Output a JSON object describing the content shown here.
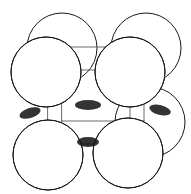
{
  "figure": {
    "caption": "",
    "width": 191,
    "height": 194,
    "background_color": "#ffffff",
    "style": "stippled pen-and-ink line drawing"
  },
  "colors": {
    "background": "#ffffff",
    "sphere_outline": "#1a1a1a",
    "cube_edge": "#5a5a5a",
    "stipple_dark": "#111111",
    "stipple_mid": "#3a3a3a",
    "highlight": "#ffffff"
  },
  "cube": {
    "label": "unit-cell-wireframe",
    "projection": "oblique",
    "depth_offset_x": 14,
    "depth_offset_y": -23,
    "front_face": {
      "x": 48,
      "y": 70,
      "width": 82,
      "height": 74
    },
    "front_corners": [
      {
        "name": "front-top-left",
        "x": 48,
        "y": 70
      },
      {
        "name": "front-top-right",
        "x": 130,
        "y": 70
      },
      {
        "name": "front-bottom-right",
        "x": 130,
        "y": 144
      },
      {
        "name": "front-bottom-left",
        "x": 48,
        "y": 144
      }
    ],
    "back_corners": [
      {
        "name": "back-top-left",
        "x": 62,
        "y": 47
      },
      {
        "name": "back-top-right",
        "x": 144,
        "y": 47
      },
      {
        "name": "back-bottom-right",
        "x": 144,
        "y": 121
      },
      {
        "name": "back-bottom-left",
        "x": 62,
        "y": 121
      }
    ]
  },
  "spheres": [
    {
      "name": "atom-back-top-left",
      "cx": 62,
      "cy": 48,
      "r": 35,
      "layer": "back",
      "shade": "dark"
    },
    {
      "name": "atom-back-top-right",
      "cx": 146,
      "cy": 48,
      "r": 35,
      "layer": "back",
      "shade": "dark"
    },
    {
      "name": "atom-back-bottom-right",
      "cx": 150,
      "cy": 122,
      "r": 35,
      "layer": "back",
      "shade": "dark"
    },
    {
      "name": "atom-front-top-left",
      "cx": 46,
      "cy": 72,
      "r": 35,
      "layer": "front",
      "shade": "light"
    },
    {
      "name": "atom-front-top-right",
      "cx": 130,
      "cy": 72,
      "r": 35,
      "layer": "front",
      "shade": "light"
    },
    {
      "name": "atom-front-bottom-left",
      "cx": 48,
      "cy": 155,
      "r": 35,
      "layer": "front",
      "shade": "light"
    },
    {
      "name": "atom-front-bottom-right",
      "cx": 128,
      "cy": 153,
      "r": 35,
      "layer": "front",
      "shade": "light"
    }
  ],
  "lighting": {
    "source": "upper-left",
    "highlight_offset_x": -0.38,
    "highlight_offset_y": -0.42,
    "shadow_side": "lower-right"
  },
  "contacts": [
    {
      "name": "contact-left",
      "x": 30,
      "y": 113
    },
    {
      "name": "contact-center-top",
      "x": 88,
      "y": 105
    },
    {
      "name": "contact-center-bottom",
      "x": 88,
      "y": 142
    },
    {
      "name": "contact-right",
      "x": 160,
      "y": 110
    }
  ]
}
